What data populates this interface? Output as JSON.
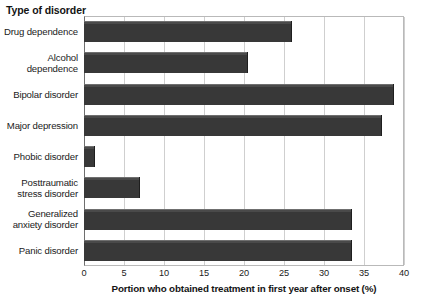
{
  "chart_data": {
    "type": "bar",
    "orientation": "horizontal",
    "title": "",
    "ylabel": "Type of disorder",
    "xlabel": "Portion who obtained treatment in first year after onset (%)",
    "xlim": [
      0,
      40
    ],
    "xticks": [
      0,
      5,
      10,
      15,
      20,
      25,
      30,
      35,
      40
    ],
    "xtick_labels": [
      "0",
      "5",
      "10",
      "15",
      "20",
      "25",
      "30",
      "35",
      "40"
    ],
    "grid": true,
    "legend": "none",
    "bar_color": "#3a3a3a",
    "categories": [
      "Drug dependence",
      "Alcohol dependence",
      "Bipolar disorder",
      "Major depression",
      "Phobic disorder",
      "Posttraumatic stress disorder",
      "Generalized anxiety disorder",
      "Panic disorder"
    ],
    "values": [
      26,
      20.5,
      38.8,
      37.2,
      1.4,
      7,
      33.5,
      33.5
    ]
  }
}
